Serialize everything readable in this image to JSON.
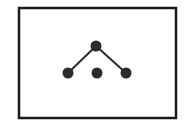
{
  "diagram": {
    "type": "graph",
    "frame": {
      "x": 19,
      "y": 8,
      "width": 157,
      "height": 110,
      "stroke": "#1a1a1a",
      "stroke_width": 2.5
    },
    "node_color": "#2b2b2b",
    "edge_color": "#2b2b2b",
    "nodes": [
      {
        "id": "top",
        "x": 96,
        "y": 46,
        "r": 5.5
      },
      {
        "id": "bottom-left",
        "x": 68,
        "y": 73,
        "r": 5.5
      },
      {
        "id": "bottom-middle",
        "x": 97,
        "y": 73,
        "r": 5.5
      },
      {
        "id": "bottom-right",
        "x": 126,
        "y": 73,
        "r": 5.5
      }
    ],
    "edges": [
      {
        "from": "top",
        "to": "bottom-left"
      },
      {
        "from": "top",
        "to": "bottom-right"
      }
    ]
  }
}
